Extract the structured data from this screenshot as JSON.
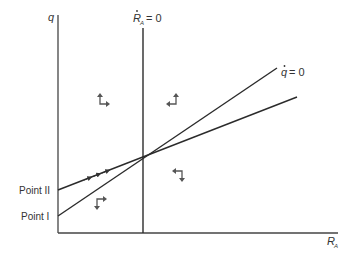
{
  "diagram": {
    "type": "phase-diagram",
    "axes": {
      "y_label": "q",
      "x_label": "R",
      "x_label_subscript": "A"
    },
    "loci": {
      "r_dot_zero": {
        "symbol": "R",
        "subscript": "A",
        "equals": "= 0"
      },
      "q_dot_zero": {
        "symbol": "q",
        "equals": "= 0"
      }
    },
    "points": [
      {
        "label": "Point II"
      },
      {
        "label": "Point I"
      }
    ],
    "arrow_quadrants": [
      {
        "position": "upper-left",
        "directions": [
          "up",
          "right"
        ]
      },
      {
        "position": "upper-right",
        "directions": [
          "up",
          "left"
        ]
      },
      {
        "position": "lower-left",
        "directions": [
          "down",
          "right"
        ]
      },
      {
        "position": "lower-right",
        "directions": [
          "down",
          "left"
        ]
      }
    ],
    "colors": {
      "line": "#2b2b2b",
      "arrow": "#555555",
      "text": "#333333"
    }
  }
}
